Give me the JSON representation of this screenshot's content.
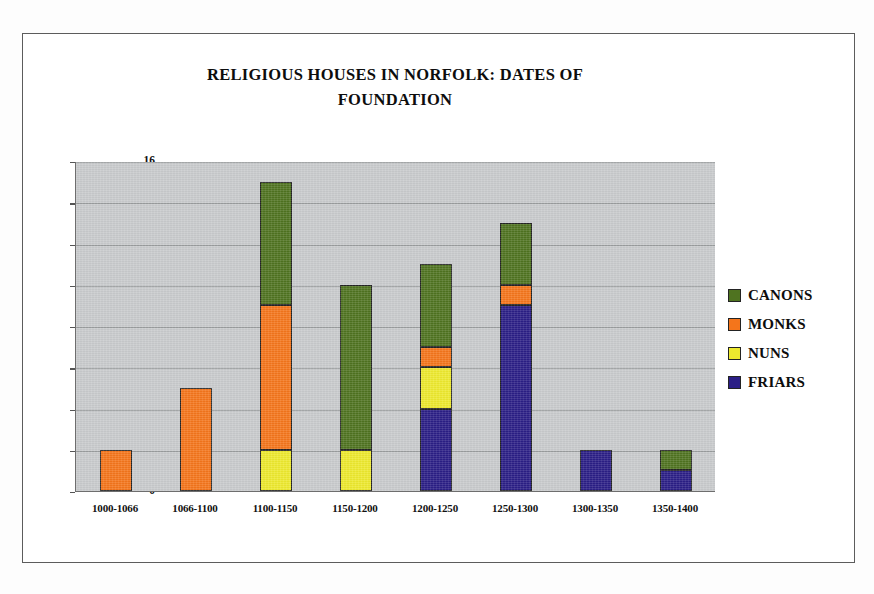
{
  "chart_data": {
    "type": "bar",
    "subtype": "stacked-column",
    "title": "RELIGIOUS HOUSES IN NORFOLK: DATES OF\nFOUNDATION",
    "xlabel": "",
    "ylabel": "",
    "ylim": [
      0,
      16
    ],
    "ytick_step": 2,
    "yticks": [
      16,
      14,
      12,
      10,
      8,
      6,
      4,
      2,
      0
    ],
    "grid": true,
    "grid_axis": "y",
    "legend_position": "right",
    "plot_background": "#c8cacc",
    "categories": [
      "1000-1066",
      "1066-1100",
      "1100-1150",
      "1150-1200",
      "1200-1250",
      "1250-1300",
      "1300-1350",
      "1350-1400"
    ],
    "stack_order_bottom_to_top": [
      "FRIARS",
      "NUNS",
      "MONKS",
      "CANONS"
    ],
    "series": [
      {
        "name": "CANONS",
        "color": "#4f7320",
        "values": [
          0,
          0,
          6,
          8,
          4,
          3,
          0,
          1
        ]
      },
      {
        "name": "MONKS",
        "color": "#f4751b",
        "values": [
          2,
          5,
          7,
          0,
          1,
          1,
          0,
          0
        ]
      },
      {
        "name": "NUNS",
        "color": "#ede92e",
        "values": [
          0,
          0,
          2,
          2,
          2,
          0,
          0,
          0
        ]
      },
      {
        "name": "FRIARS",
        "color": "#2b1e86",
        "values": [
          0,
          0,
          0,
          0,
          4,
          9,
          2,
          1
        ]
      }
    ],
    "totals": [
      2,
      5,
      15,
      10,
      11,
      13,
      2,
      2
    ]
  },
  "legend": {
    "items": [
      {
        "label": "CANONS",
        "color": "#4f7320"
      },
      {
        "label": "MONKS",
        "color": "#f4751b"
      },
      {
        "label": "NUNS",
        "color": "#ede92e"
      },
      {
        "label": "FRIARS",
        "color": "#2b1e86"
      }
    ]
  }
}
